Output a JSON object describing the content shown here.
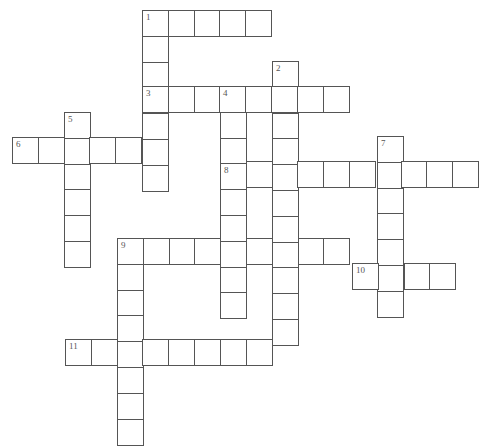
{
  "puzzle": {
    "type": "crossword",
    "cell_size": 25.8,
    "border_color": "#555555",
    "background": "#ffffff",
    "entries": [
      {
        "number": "1",
        "direction": "across",
        "x": 142,
        "y": 10,
        "length": 5
      },
      {
        "number": "1",
        "direction": "down",
        "x": 142,
        "y": 10,
        "length": 7
      },
      {
        "number": "2",
        "direction": "down",
        "x": 272,
        "y": 61,
        "length": 11
      },
      {
        "number": "3",
        "direction": "across",
        "x": 142,
        "y": 86,
        "length": 8
      },
      {
        "number": "4",
        "direction": "down",
        "x": 220,
        "y": 86,
        "length": 9
      },
      {
        "number": "5",
        "direction": "down",
        "x": 64,
        "y": 112,
        "length": 6
      },
      {
        "number": "6",
        "direction": "across",
        "x": 12,
        "y": 137,
        "length": 6
      },
      {
        "number": "7",
        "direction": "down",
        "x": 377,
        "y": 136,
        "length": 7
      },
      {
        "number": "8",
        "direction": "across",
        "x": 220,
        "y": 161,
        "length": 10
      },
      {
        "number": "9",
        "direction": "across",
        "x": 117,
        "y": 238,
        "length": 9
      },
      {
        "number": "9",
        "direction": "down",
        "x": 117,
        "y": 238,
        "length": 8
      },
      {
        "number": "10",
        "direction": "across",
        "x": 352,
        "y": 263,
        "length": 4
      },
      {
        "number": "11",
        "direction": "across",
        "x": 65,
        "y": 339,
        "length": 8
      }
    ]
  }
}
